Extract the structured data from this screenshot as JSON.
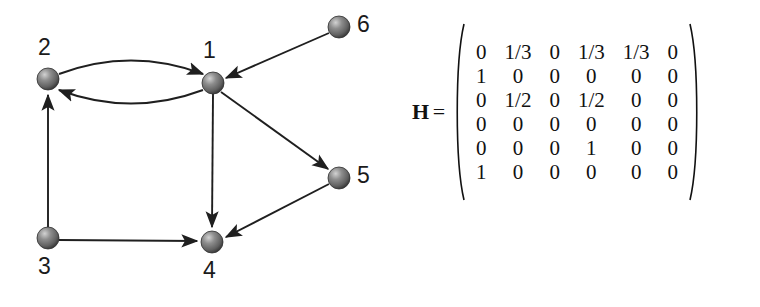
{
  "figure": {
    "background_color": "#ffffff",
    "ink_color": "#1b1b1b"
  },
  "graph": {
    "title": "",
    "node_color": "#6d6d6d",
    "node_highlight_color": "#c9c9c9",
    "edge_color": "#1f1f1f",
    "nodes": [
      {
        "id": "1",
        "label": "1",
        "cx": 213,
        "cy": 83,
        "r": 11,
        "label_x": 203,
        "label_y": 39
      },
      {
        "id": "2",
        "label": "2",
        "cx": 48,
        "cy": 79,
        "r": 11,
        "label_x": 38,
        "label_y": 36
      },
      {
        "id": "3",
        "label": "3",
        "cx": 48,
        "cy": 238,
        "r": 11,
        "label_x": 38,
        "label_y": 255
      },
      {
        "id": "4",
        "label": "4",
        "cx": 212,
        "cy": 242,
        "r": 11,
        "label_x": 203,
        "label_y": 259
      },
      {
        "id": "5",
        "label": "5",
        "cx": 339,
        "cy": 178,
        "r": 11,
        "label_x": 357,
        "label_y": 164
      },
      {
        "id": "6",
        "label": "6",
        "cx": 339,
        "cy": 27,
        "r": 11,
        "label_x": 357,
        "label_y": 13
      }
    ],
    "edges": [
      {
        "from": "2",
        "to": "1",
        "style": "curved-upper"
      },
      {
        "from": "1",
        "to": "2",
        "style": "curved-lower"
      },
      {
        "from": "3",
        "to": "2",
        "style": "straight"
      },
      {
        "from": "3",
        "to": "4",
        "style": "straight"
      },
      {
        "from": "1",
        "to": "4",
        "style": "straight"
      },
      {
        "from": "1",
        "to": "5",
        "style": "straight"
      },
      {
        "from": "5",
        "to": "4",
        "style": "straight"
      },
      {
        "from": "6",
        "to": "1",
        "style": "straight"
      }
    ]
  },
  "matrix": {
    "name": "H",
    "equals": "=",
    "rows": 6,
    "cols": 6,
    "values": [
      [
        "0",
        "1/3",
        "0",
        "1/3",
        "1/3",
        "0"
      ],
      [
        "1",
        "0",
        "0",
        "0",
        "0",
        "0"
      ],
      [
        "0",
        "1/2",
        "0",
        "1/2",
        "0",
        "0"
      ],
      [
        "0",
        "0",
        "0",
        "0",
        "0",
        "0"
      ],
      [
        "0",
        "0",
        "0",
        "1",
        "0",
        "0"
      ],
      [
        "1",
        "0",
        "0",
        "0",
        "0",
        "0"
      ]
    ]
  }
}
